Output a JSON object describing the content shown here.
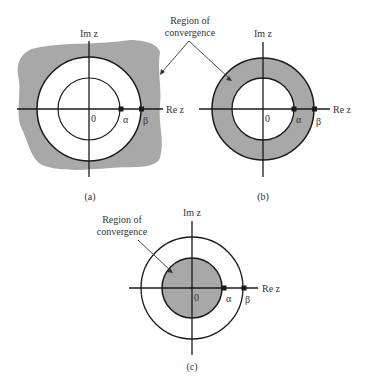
{
  "colors": {
    "roc_fill": "#a8a8a8",
    "line": "#1a1a1a",
    "background": "#ffffff"
  },
  "annotations": {
    "top_roc_line1": "Region of",
    "top_roc_line2": "convergence",
    "c_roc_line1": "Region of",
    "c_roc_line2": "convergence"
  },
  "panels": [
    {
      "id": "a",
      "caption": "(a)",
      "im_label": "Im z",
      "re_label": "Re z",
      "origin_label": "0",
      "pole_alpha": "α",
      "pole_beta": "β",
      "roc": "|z| > β (exterior of outer circle)"
    },
    {
      "id": "b",
      "caption": "(b)",
      "im_label": "Im z",
      "re_label": "Re z",
      "origin_label": "0",
      "pole_alpha": "α",
      "pole_beta": "β",
      "roc": "α < |z| < β (annulus)"
    },
    {
      "id": "c",
      "caption": "(c)",
      "im_label": "Im z",
      "re_label": "Re z",
      "origin_label": "0",
      "pole_alpha": "α",
      "pole_beta": "β",
      "roc": "|z| < α (interior of inner circle)"
    }
  ]
}
